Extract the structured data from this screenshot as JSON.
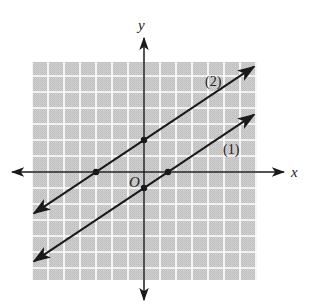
{
  "chart_data": {
    "type": "line",
    "title": "",
    "xlabel": "x",
    "ylabel": "y",
    "origin_label": "O",
    "grid": true,
    "xlim": [
      -7,
      7
    ],
    "ylim": [
      -7,
      7
    ],
    "grid_step": 1,
    "series": [
      {
        "name": "(1)",
        "slope": 0.6667,
        "intercept": -1,
        "x_intercept": 1.5,
        "y_intercept": -1,
        "marked_points": [
          [
            1.5,
            0
          ],
          [
            0,
            -1
          ]
        ]
      },
      {
        "name": "(2)",
        "slope": 0.6667,
        "intercept": 2,
        "x_intercept": -3,
        "y_intercept": 2,
        "marked_points": [
          [
            -3,
            0
          ],
          [
            0,
            2
          ]
        ]
      }
    ]
  },
  "colors": {
    "grid_fill": "#c9c9c9",
    "grid_lines": "#ffffff",
    "ink": "#1a1a1a"
  }
}
